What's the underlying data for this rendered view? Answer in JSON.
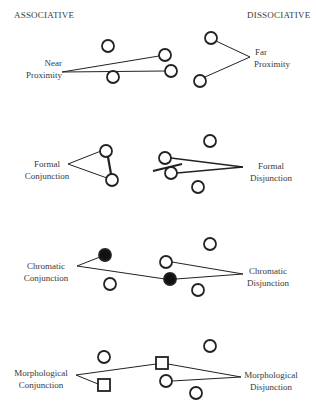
{
  "headers": {
    "left": "ASSOCIATIVE",
    "right": "DISSOCIATIVE"
  },
  "rows": [
    {
      "name": "proximity",
      "associative": {
        "line1": "Near",
        "line2": "Proximity"
      },
      "dissociative": {
        "line1": "Far",
        "line2": "Proximity"
      }
    },
    {
      "name": "formal",
      "associative": {
        "line1": "Formal",
        "line2": "Conjunction"
      },
      "dissociative": {
        "line1": "Formal",
        "line2": "Disjunction"
      }
    },
    {
      "name": "chromatic",
      "associative": {
        "line1": "Chromatic",
        "line2": "Conjunction"
      },
      "dissociative": {
        "line1": "Chromatic",
        "line2": "Disjunction"
      }
    },
    {
      "name": "morphological",
      "associative": {
        "line1": "Morphological",
        "line2": "Conjunction"
      },
      "dissociative": {
        "line1": "Morphological",
        "line2": "Disjunction"
      }
    }
  ],
  "colors": {
    "stroke": "#222222",
    "text": "#3a3a3a",
    "background": "#ffffff"
  }
}
